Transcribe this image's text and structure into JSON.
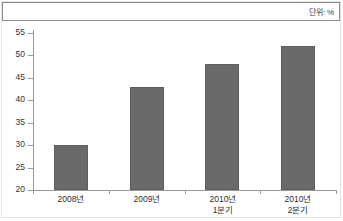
{
  "unit": {
    "label": "단위: %"
  },
  "chart_data": {
    "type": "bar",
    "title": "",
    "subtitle": "",
    "xlabel": "",
    "ylabel": "",
    "unit_note": "단위: %",
    "categories": [
      "2008년",
      "2009년",
      "2010년 1분기",
      "2010년 2분기"
    ],
    "category_lines": [
      [
        "2008년",
        ""
      ],
      [
        "2009년",
        ""
      ],
      [
        "2010년",
        "1분기"
      ],
      [
        "2010년",
        "2분기"
      ]
    ],
    "values": [
      30,
      43,
      48,
      52
    ],
    "ylim": [
      20,
      55
    ],
    "yticks": [
      20,
      25,
      30,
      35,
      40,
      45,
      50,
      55
    ],
    "ytick_labels": [
      "20",
      "25",
      "30",
      "35",
      "40",
      "45",
      "50",
      "55"
    ],
    "grid": false,
    "legend": "none",
    "bar_color": "#6a6a6a",
    "axis_color": "#9a9a9a",
    "text_color": "#2e2e2e"
  }
}
